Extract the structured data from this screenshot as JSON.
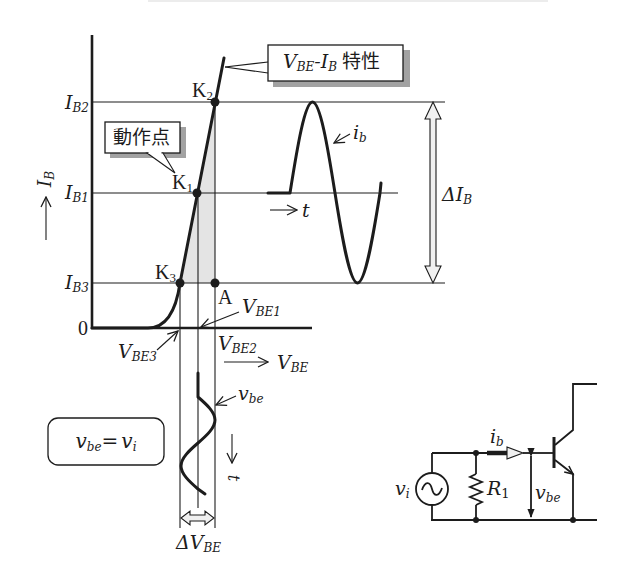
{
  "colors": {
    "ink": "#1c1c1c",
    "shade": "#e4e4e4",
    "shadow": "#a2a2a2",
    "background": "#ffffff",
    "hollow": "#f0f0f0"
  },
  "axes": {
    "y_label": {
      "main": "I",
      "sub": "B"
    },
    "x_label": {
      "main": "V",
      "sub": "BE"
    },
    "origin": "0",
    "y_ticks": [
      {
        "main": "I",
        "sub": "B2"
      },
      {
        "main": "I",
        "sub": "B1"
      },
      {
        "main": "I",
        "sub": "B3"
      }
    ],
    "x_ticks": [
      {
        "main": "V",
        "sub": "BE3"
      },
      {
        "main": "V",
        "sub": "BE1"
      },
      {
        "main": "V",
        "sub": "BE2"
      }
    ]
  },
  "points": {
    "k2": {
      "main": "K",
      "sub": "2"
    },
    "k1": {
      "main": "K",
      "sub": "1"
    },
    "k3": {
      "main": "K",
      "sub": "3"
    },
    "a": "A"
  },
  "callouts": {
    "characteristic": {
      "v": "V",
      "v_sub": "BE",
      "sep": "-",
      "i": "I",
      "i_sub": "B",
      "text": "特性"
    },
    "operating_point": "動作点"
  },
  "ib_wave": {
    "label": {
      "main": "i",
      "sub": "b"
    },
    "time_axis": "t"
  },
  "delta_ib": {
    "main": "ΔI",
    "sub": "B"
  },
  "vbe_wave": {
    "label": {
      "main": "v",
      "sub": "be"
    },
    "time_axis": "t"
  },
  "delta_vbe": {
    "main": "ΔV",
    "sub": "BE"
  },
  "equation_box": {
    "lhs": "v",
    "lhs_sub": "be",
    "eq": "=",
    "rhs": "v",
    "rhs_sub": "i"
  },
  "circuit": {
    "source": {
      "main": "v",
      "sub": "i"
    },
    "resistor": {
      "main": "R",
      "sub": "1"
    },
    "current": {
      "main": "i",
      "sub": "b"
    },
    "voltage": {
      "main": "v",
      "sub": "be"
    }
  }
}
